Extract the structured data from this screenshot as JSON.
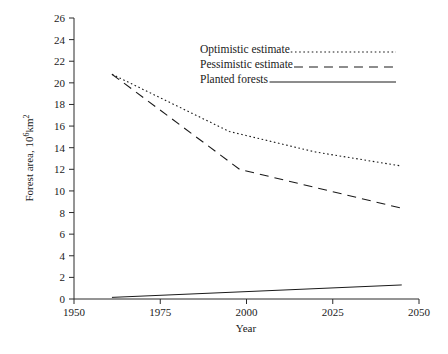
{
  "chart_data": {
    "type": "line",
    "title": "",
    "xlabel": "Year",
    "ylabel": "Forest area, 10⁶km²",
    "xlim": [
      1950,
      2050
    ],
    "ylim": [
      0,
      26
    ],
    "xticks": [
      1950,
      1975,
      2000,
      2025,
      2050
    ],
    "xtick_labels": [
      "1950",
      "1975",
      "2000",
      "2025",
      "2050"
    ],
    "yticks": [
      0,
      2,
      4,
      6,
      8,
      10,
      12,
      14,
      16,
      18,
      20,
      22,
      24,
      26
    ],
    "ytick_labels": [
      "0",
      "2",
      "4",
      "6",
      "8",
      "10",
      "12",
      "14",
      "16",
      "18",
      "20",
      "22",
      "24",
      "26"
    ],
    "grid": false,
    "legend_position": "top-right",
    "series": [
      {
        "name": "Optimistic estimate",
        "style": "dotted",
        "x": [
          1961,
          1995,
          2020,
          2045
        ],
        "values": [
          20.8,
          15.5,
          13.6,
          12.3
        ]
      },
      {
        "name": "Pessimistic estimate",
        "style": "dashed",
        "x": [
          1961,
          1998,
          2045
        ],
        "values": [
          20.8,
          12.0,
          8.4
        ]
      },
      {
        "name": "Planted forests",
        "style": "solid",
        "x": [
          1961,
          2045
        ],
        "values": [
          0.15,
          1.3
        ]
      }
    ]
  },
  "legend": {
    "items": [
      {
        "label": "Optimistic estimate",
        "style": "dotted"
      },
      {
        "label": "Pessimistic estimate",
        "style": "dashed"
      },
      {
        "label": "Planted forests",
        "style": "solid"
      }
    ]
  },
  "axes": {
    "x_title": "Year",
    "y_title": "Forest area, 10⁶km²"
  },
  "colors": {
    "line": "#1a1a1a",
    "axis": "#2a2a2a",
    "background": "#ffffff"
  }
}
